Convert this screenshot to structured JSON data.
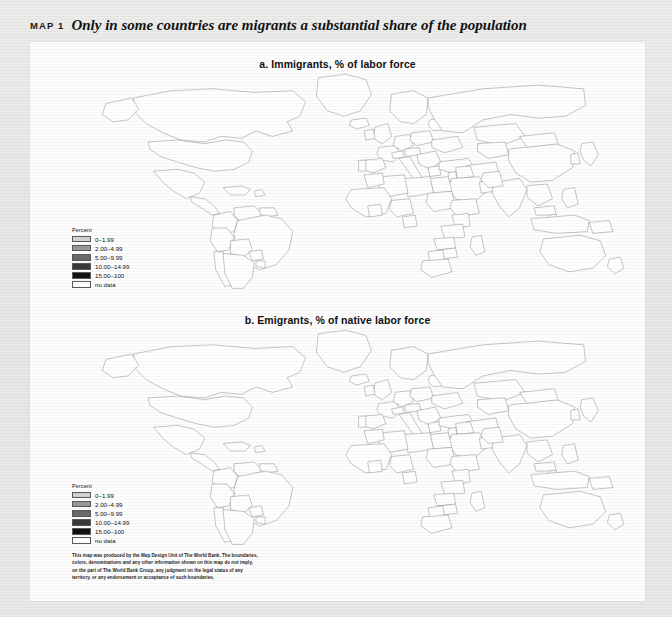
{
  "figure": {
    "map_label": "MAP 1",
    "title": "Only in some countries are migrants a substantial share of the population"
  },
  "panels": {
    "a": {
      "subtitle": "a. Immigrants, % of labor force"
    },
    "b": {
      "subtitle": "b. Emigrants, % of native labor force"
    }
  },
  "legend": {
    "title": "Percent",
    "entries": [
      {
        "label": "0–1.99",
        "color": "#d4d4d4"
      },
      {
        "label": "2.00–4.99",
        "color": "#9a9a9a"
      },
      {
        "label": "5.00–9.99",
        "color": "#6a6a6a"
      },
      {
        "label": "10.00–14.99",
        "color": "#3a3a3a"
      },
      {
        "label": "15.00–100",
        "color": "#111111"
      },
      {
        "label": "no data",
        "color": "#ffffff"
      }
    ]
  },
  "source_note": "This map was produced by the Map Design Unit of The World Bank. The boundaries, colors, denominations and any other information shown on this map do not imply, on the part of The World Bank Group, any judgment on the legal status of any territory, or any endorsement or acceptance of such boundaries.",
  "chart_data": {
    "type": "heatmap",
    "subtype": "choropleth-world-map",
    "title": "Only in some countries are migrants a substantial share of the population",
    "legend_title": "Percent",
    "legend_position": "lower-left",
    "classes": [
      {
        "range": "0–1.99",
        "min": 0,
        "max": 1.99,
        "color": "#d4d4d4"
      },
      {
        "range": "2.00–4.99",
        "min": 2,
        "max": 4.99,
        "color": "#9a9a9a"
      },
      {
        "range": "5.00–9.99",
        "min": 5,
        "max": 9.99,
        "color": "#6a6a6a"
      },
      {
        "range": "10.00–14.99",
        "min": 10,
        "max": 14.99,
        "color": "#3a3a3a"
      },
      {
        "range": "15.00–100",
        "min": 15,
        "max": 100,
        "color": "#111111"
      },
      {
        "range": "no data",
        "min": null,
        "max": null,
        "color": "#ffffff"
      }
    ],
    "panels": [
      {
        "id": "a",
        "title": "a. Immigrants, % of labor force",
        "units": "% of labor force",
        "regions": {
          "canada": "15.00-100",
          "greenland": "15.00-100",
          "united_states": "15.00-100",
          "mexico": "0-1.99",
          "central_america": "0-1.99",
          "caribbean": "no data",
          "colombia": "0-1.99",
          "venezuela": "5.00-9.99",
          "guyanas": "10.00-14.99",
          "brazil": "0-1.99",
          "peru": "0-1.99",
          "bolivia": "0-1.99",
          "chile": "0-1.99",
          "argentina": "2.00-4.99",
          "uruguay": "2.00-4.99",
          "paraguay": "2.00-4.99",
          "iceland": "15.00-100",
          "nordics": "15.00-100",
          "united_kingdom": "5.00-9.99",
          "ireland": "10.00-14.99",
          "france": "10.00-14.99",
          "spain": "5.00-9.99",
          "portugal": "5.00-9.99",
          "germany": "10.00-14.99",
          "switzerland": "15.00-100",
          "austria": "15.00-100",
          "italy": "2.00-4.99",
          "poland": "0-1.99",
          "baltics": "15.00-100",
          "ukraine": "10.00-14.99",
          "balkans": "5.00-9.99",
          "greece": "5.00-9.99",
          "russia": "2.00-4.99",
          "kazakhstan": "5.00-9.99",
          "central_asia": "5.00-9.99",
          "turkey": "0-1.99",
          "israel": "15.00-100",
          "saudi_arabia": "15.00-100",
          "gulf_states": "15.00-100",
          "iran": "2.00-4.99",
          "iraq": "0-1.99",
          "libya": "15.00-100",
          "egypt": "0-1.99",
          "algeria": "0-1.99",
          "morocco": "0-1.99",
          "west_africa": "0-1.99",
          "cote_divoire": "10.00-14.99",
          "gabon": "15.00-100",
          "nigeria": "0-1.99",
          "sudan": "0-1.99",
          "ethiopia": "0-1.99",
          "kenya": "0-1.99",
          "tanzania": "0-1.99",
          "zambia": "2.00-4.99",
          "zimbabwe": "2.00-4.99",
          "botswana": "5.00-9.99",
          "south_africa": "2.00-4.99",
          "madagascar": "0-1.99",
          "india": "0-1.99",
          "pakistan": "0-1.99",
          "china": "0-1.99",
          "mongolia": "0-1.99",
          "japan": "0-1.99",
          "korea": "0-1.99",
          "southeast_asia": "0-1.99",
          "malaysia": "5.00-9.99",
          "singapore": "15.00-100",
          "indonesia": "0-1.99",
          "philippines": "0-1.99",
          "papua_new_guinea": "0-1.99",
          "australia": "15.00-100",
          "new_zealand": "15.00-100"
        }
      },
      {
        "id": "b",
        "title": "b. Emigrants, % of native labor force",
        "units": "% of native labor force",
        "regions": {
          "canada": "5.00-9.99",
          "greenland": "5.00-9.99",
          "united_states": "0-1.99",
          "mexico": "15.00-100",
          "central_america": "15.00-100",
          "caribbean": "15.00-100",
          "colombia": "2.00-4.99",
          "venezuela": "0-1.99",
          "guyanas": "15.00-100",
          "brazil": "0-1.99",
          "peru": "5.00-9.99",
          "bolivia": "5.00-9.99",
          "chile": "2.00-4.99",
          "argentina": "2.00-4.99",
          "uruguay": "10.00-14.99",
          "paraguay": "5.00-9.99",
          "iceland": "10.00-14.99",
          "nordics": "2.00-4.99",
          "united_kingdom": "5.00-9.99",
          "ireland": "15.00-100",
          "france": "2.00-4.99",
          "spain": "2.00-4.99",
          "portugal": "15.00-100",
          "germany": "5.00-9.99",
          "switzerland": "5.00-9.99",
          "austria": "5.00-9.99",
          "italy": "5.00-9.99",
          "poland": "5.00-9.99",
          "baltics": "5.00-9.99",
          "ukraine": "5.00-9.99",
          "balkans": "15.00-100",
          "greece": "10.00-14.99",
          "russia": "2.00-4.99",
          "kazakhstan": "10.00-14.99",
          "central_asia": "5.00-9.99",
          "turkey": "5.00-9.99",
          "israel": "5.00-9.99",
          "saudi_arabia": "0-1.99",
          "gulf_states": "0-1.99",
          "iran": "2.00-4.99",
          "iraq": "5.00-9.99",
          "libya": "0-1.99",
          "egypt": "2.00-4.99",
          "algeria": "5.00-9.99",
          "morocco": "15.00-100",
          "west_africa": "5.00-9.99",
          "cote_divoire": "2.00-4.99",
          "gabon": "2.00-4.99",
          "nigeria": "0-1.99",
          "sudan": "2.00-4.99",
          "ethiopia": "0-1.99",
          "kenya": "2.00-4.99",
          "tanzania": "0-1.99",
          "zambia": "2.00-4.99",
          "zimbabwe": "5.00-9.99",
          "botswana": "5.00-9.99",
          "south_africa": "2.00-4.99",
          "madagascar": "0-1.99",
          "india": "0-1.99",
          "pakistan": "2.00-4.99",
          "china": "0-1.99",
          "mongolia": "0-1.99",
          "japan": "0-1.99",
          "korea": "5.00-9.99",
          "southeast_asia": "5.00-9.99",
          "malaysia": "5.00-9.99",
          "singapore": "10.00-14.99",
          "indonesia": "0-1.99",
          "philippines": "5.00-9.99",
          "papua_new_guinea": "0-1.99",
          "australia": "0-1.99",
          "new_zealand": "10.00-14.99"
        }
      }
    ]
  }
}
